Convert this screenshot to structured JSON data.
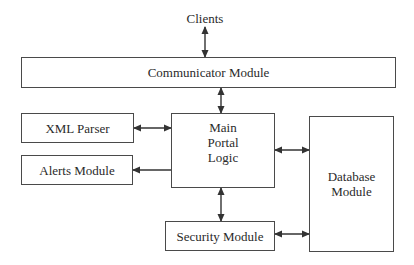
{
  "diagram": {
    "type": "block-architecture",
    "nodes": [
      {
        "id": "clients",
        "label": "Clients"
      },
      {
        "id": "communicator",
        "label": "Communicator Module"
      },
      {
        "id": "xml",
        "label": "XML Parser"
      },
      {
        "id": "alerts",
        "label": "Alerts Module"
      },
      {
        "id": "main",
        "label_lines": [
          "Main",
          "Portal",
          "Logic"
        ]
      },
      {
        "id": "database",
        "label_lines": [
          "Database",
          "Module"
        ]
      },
      {
        "id": "security",
        "label": "Security Module"
      }
    ],
    "edges": [
      {
        "from": "clients",
        "to": "communicator",
        "direction": "both"
      },
      {
        "from": "communicator",
        "to": "main",
        "direction": "both"
      },
      {
        "from": "xml",
        "to": "main",
        "direction": "both"
      },
      {
        "from": "main",
        "to": "alerts",
        "direction": "forward"
      },
      {
        "from": "main",
        "to": "database",
        "direction": "both"
      },
      {
        "from": "main",
        "to": "security",
        "direction": "both"
      },
      {
        "from": "security",
        "to": "database",
        "direction": "both"
      }
    ],
    "colors": {
      "line": "#333333",
      "box_border": "#4a4a4a",
      "background": "#ffffff"
    }
  }
}
